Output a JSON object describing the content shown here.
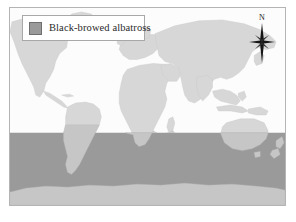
{
  "figure": {
    "type": "distribution-map",
    "background_color": "#ffffff",
    "frame_border_color": "#b4b4b4"
  },
  "legend": {
    "label": "Black-browed albatross",
    "swatch_color": "#9a9a9a",
    "swatch_border_color": "#6f6f6f",
    "box_border_color": "#a8a8a8",
    "box_background": "#ffffff"
  },
  "compass": {
    "label": "N",
    "icon": "compass-rose-icon",
    "color": "#1a1a1a"
  },
  "map": {
    "ocean_color": "#fcfcfc",
    "land_color": "#d7d7d7",
    "land_outline_color": "#c9c9c9",
    "range_color": "#9a9a9a",
    "range_land_color": "#c6c6c6",
    "range_description": "Shaded band covering all southern ocean latitudes",
    "range_band_top_fraction": 0.634,
    "projection": "equirectangular"
  },
  "chart_data": {
    "type": "map",
    "title": "Black-browed albatross",
    "series": [
      {
        "name": "Black-browed albatross",
        "color": "#9a9a9a",
        "geometry": "latitude-band",
        "lat_min": -90,
        "lat_max": -38,
        "lon_min": -180,
        "lon_max": 180
      }
    ],
    "legend_position": "top-left",
    "xlabel": "",
    "ylabel": "",
    "grid": false
  }
}
